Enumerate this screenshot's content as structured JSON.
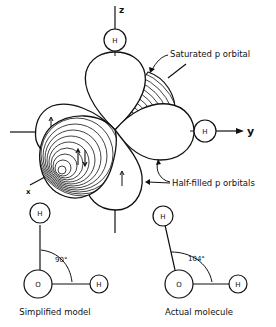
{
  "diagram": {
    "axes": {
      "z": "z",
      "y": "y",
      "x": "x"
    },
    "labels": {
      "saturated": "Saturated p orbital",
      "half_filled": "Half-filled p orbitals"
    },
    "atoms": {
      "hydrogen": "H",
      "oxygen": "O"
    },
    "models": [
      {
        "caption": "Simplified model",
        "angle": "90°"
      },
      {
        "caption": "Actual molecule",
        "angle": "104°"
      }
    ]
  }
}
